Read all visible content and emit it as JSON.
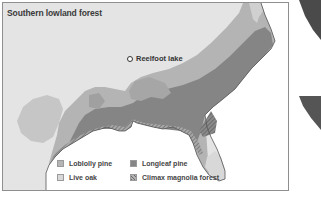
{
  "map": {
    "title": "Southern lowland forest",
    "marker": {
      "label": "Reelfoot lake",
      "icon": "circle-marker-icon"
    },
    "legend": [
      {
        "label": "Loblolly pine",
        "color": "#b4b4b4",
        "pattern": "solid"
      },
      {
        "label": "Live oak",
        "color": "#d8d8d8",
        "pattern": "solid"
      },
      {
        "label": "Longleaf pine",
        "color": "#858585",
        "pattern": "solid"
      },
      {
        "label": "Climax magnolia forest",
        "color": "#9a9a9a",
        "pattern": "hatched"
      }
    ],
    "colors": {
      "background": "#e4e4e4",
      "water": "#ffffff",
      "loblolly": "#b4b4b4",
      "live_oak": "#d8d8d8",
      "longleaf": "#858585",
      "magnolia": "#8a8a8a",
      "border": "#8f8f8f"
    }
  }
}
